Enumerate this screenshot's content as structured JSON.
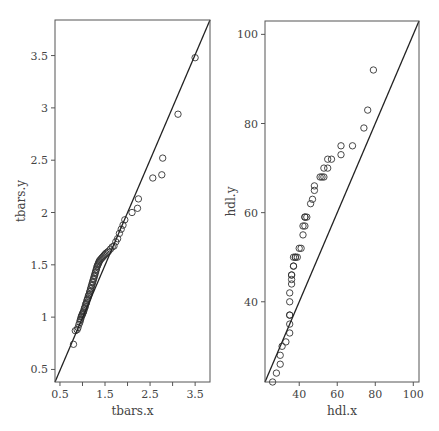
{
  "chart_data": [
    {
      "type": "scatter",
      "title": "",
      "xlabel": "tbars.x",
      "ylabel": "tbars.y",
      "xlim": [
        0.39,
        3.83
      ],
      "ylim": [
        0.38,
        3.84
      ],
      "xticks": [
        0.5,
        1,
        1.5,
        2,
        2.5,
        3,
        3.5
      ],
      "xtick_labels": [
        "0.5",
        "",
        "1.5",
        "",
        "2.5",
        "",
        "3.5"
      ],
      "yticks": [
        0.5,
        1,
        1.5,
        2,
        2.5,
        3,
        3.5
      ],
      "ytick_labels": [
        "0.5",
        "1",
        "1.5",
        "2",
        "2.5",
        "3",
        "3.5"
      ],
      "grid": false,
      "reference_line": {
        "x": [
          0.39,
          3.83
        ],
        "y": [
          0.38,
          3.84
        ],
        "label": "y = x"
      },
      "points": {
        "x": [
          0.8,
          0.84,
          0.88,
          0.9,
          0.92,
          0.94,
          0.95,
          0.96,
          0.97,
          0.98,
          0.99,
          1.0,
          1.01,
          1.02,
          1.03,
          1.04,
          1.05,
          1.06,
          1.07,
          1.08,
          1.09,
          1.1,
          1.11,
          1.12,
          1.13,
          1.14,
          1.15,
          1.16,
          1.17,
          1.18,
          1.19,
          1.2,
          1.21,
          1.22,
          1.23,
          1.24,
          1.25,
          1.26,
          1.27,
          1.28,
          1.29,
          1.3,
          1.31,
          1.32,
          1.33,
          1.34,
          1.35,
          1.36,
          1.37,
          1.38,
          1.4,
          1.42,
          1.44,
          1.46,
          1.48,
          1.5,
          1.52,
          1.55,
          1.58,
          1.62,
          1.66,
          1.7,
          1.74,
          1.78,
          1.82,
          1.86,
          1.9,
          1.94,
          2.1,
          2.22,
          2.24,
          2.56,
          2.76,
          2.78,
          3.12,
          3.5
        ],
        "y": [
          0.74,
          0.87,
          0.88,
          0.9,
          0.93,
          0.95,
          0.97,
          0.98,
          1.0,
          1.01,
          1.02,
          1.03,
          1.04,
          1.05,
          1.06,
          1.08,
          1.09,
          1.1,
          1.12,
          1.13,
          1.14,
          1.16,
          1.17,
          1.18,
          1.2,
          1.21,
          1.22,
          1.24,
          1.25,
          1.27,
          1.28,
          1.3,
          1.31,
          1.33,
          1.34,
          1.36,
          1.37,
          1.39,
          1.4,
          1.42,
          1.43,
          1.45,
          1.46,
          1.48,
          1.49,
          1.5,
          1.51,
          1.52,
          1.53,
          1.54,
          1.55,
          1.56,
          1.57,
          1.58,
          1.59,
          1.6,
          1.61,
          1.62,
          1.63,
          1.65,
          1.67,
          1.68,
          1.72,
          1.75,
          1.8,
          1.84,
          1.88,
          1.93,
          2.0,
          2.04,
          2.13,
          2.33,
          2.36,
          2.52,
          2.94,
          3.48
        ]
      },
      "marker": "open-circle"
    },
    {
      "type": "scatter",
      "title": "",
      "xlabel": "hdl.x",
      "ylabel": "hdl.y",
      "xlim": [
        22,
        103
      ],
      "ylim": [
        22,
        103
      ],
      "xticks": [
        40,
        60,
        80,
        100
      ],
      "xtick_labels": [
        "40",
        "60",
        "80",
        "100"
      ],
      "yticks": [
        40,
        60,
        80,
        100
      ],
      "ytick_labels": [
        "40",
        "60",
        "80",
        "100"
      ],
      "grid": false,
      "reference_line": {
        "x": [
          22,
          103
        ],
        "y": [
          22,
          103
        ],
        "label": "y = x"
      },
      "points": {
        "x": [
          26,
          28,
          30,
          30,
          31,
          33,
          35,
          35,
          35,
          35,
          35,
          35,
          36,
          36,
          36,
          36,
          37,
          37,
          37,
          38,
          38,
          39,
          40,
          41,
          42,
          42,
          43,
          43,
          43,
          44,
          46,
          47,
          48,
          48,
          51,
          52,
          53,
          53,
          55,
          55,
          57,
          62,
          62,
          68,
          74,
          76,
          79
        ],
        "y": [
          22,
          24,
          26,
          28,
          30,
          31,
          33,
          35,
          37,
          37,
          40,
          42,
          44,
          45,
          46,
          46,
          48,
          48,
          50,
          50,
          50,
          50,
          52,
          52,
          55,
          57,
          57,
          59,
          59,
          59,
          62,
          63,
          65,
          66,
          68,
          68,
          68,
          70,
          70,
          72,
          72,
          73,
          75,
          75,
          79,
          83,
          92
        ]
      },
      "marker": "open-circle"
    }
  ],
  "colors": {
    "frame": "#555555",
    "points": "#333333",
    "line": "#222222",
    "text": "#444444",
    "background": "#ffffff"
  }
}
